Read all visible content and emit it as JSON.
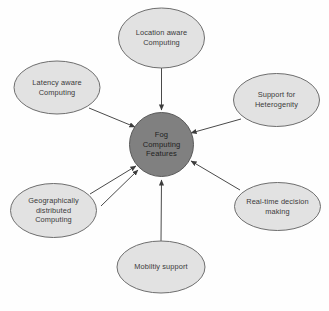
{
  "diagram": {
    "title": "Fog Computing Features",
    "type": "hub-and-spoke",
    "background_color": "#fefefe",
    "center": {
      "id": "fog-computing-features",
      "label": "Fog\nComputing\nFeatures",
      "shape": "circle",
      "fill_color": "#808080",
      "stroke_color": "#5a5a5a",
      "text_color": "#1f1f1f",
      "cx": 161.5,
      "cy": 144.5,
      "r": 32
    },
    "node_style": {
      "shape": "ellipse",
      "fill_color": "#e2e2e2",
      "stroke_color": "#6e6e6e",
      "text_color": "#3a3a3a"
    },
    "edge_style": {
      "stroke_color": "#4a4a4a",
      "stroke_width": 1,
      "arrow": "filled-triangle",
      "direction": "feature-to-center"
    },
    "nodes": [
      {
        "id": "location-aware-computing",
        "label": "Location aware\nComputing",
        "cx": 161.5,
        "cy": 38,
        "rx": 43,
        "ry": 30,
        "edge": {
          "x1": 161.5,
          "y1": 68,
          "x2": 161.5,
          "y2": 110
        }
      },
      {
        "id": "latency-aware-computing",
        "label": "Latency aware\nComputing",
        "cx": 57,
        "cy": 87.5,
        "rx": 43,
        "ry": 26.5,
        "edge": {
          "x1": 89,
          "y1": 108,
          "x2": 135,
          "y2": 127
        }
      },
      {
        "id": "support-for-heterogenity",
        "label": "Support for\nHeterogenity",
        "cx": 276.5,
        "cy": 100,
        "rx": 43,
        "ry": 26.5,
        "edge": {
          "x1": 241,
          "y1": 119,
          "x2": 191,
          "y2": 133
        }
      },
      {
        "id": "real-time-decision-making",
        "label": "Real-time decision\nmaking",
        "cx": 277.5,
        "cy": 206.5,
        "rx": 43,
        "ry": 24,
        "edge": {
          "x1": 240,
          "y1": 190,
          "x2": 191,
          "y2": 161
        }
      },
      {
        "id": "geographically-distributed-computing",
        "label": "Geographically\ndistributed\nComputing",
        "cx": 53.5,
        "cy": 210.5,
        "rx": 43,
        "ry": 27,
        "edge": {
          "x1": 90,
          "y1": 194,
          "x2": 136,
          "y2": 166
        }
      },
      {
        "id": "mobiltiy-support",
        "label": "Mobiltiy support",
        "cx": 161,
        "cy": 267,
        "rx": 44,
        "ry": 26,
        "edge": {
          "x1": 161,
          "y1": 241,
          "x2": 161.5,
          "y2": 180
        }
      }
    ],
    "extra_edges": [
      {
        "id": "edge-lower-left-secondary",
        "x1": 101,
        "y1": 206,
        "x2": 138,
        "y2": 170
      }
    ]
  }
}
